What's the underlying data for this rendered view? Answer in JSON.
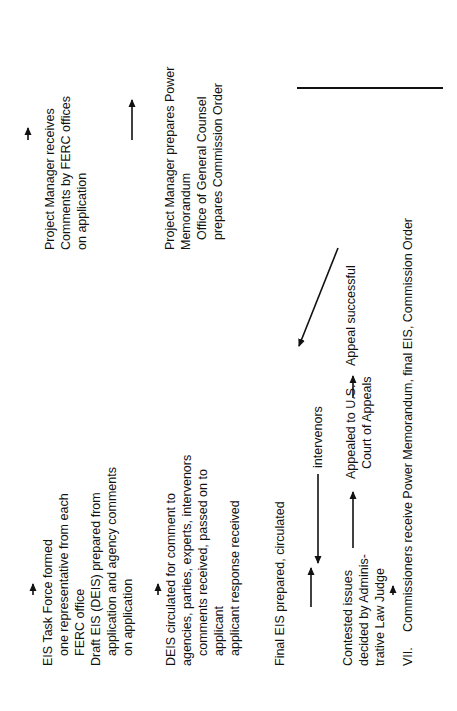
{
  "blocks": {
    "task_force": {
      "lines": [
        "EIS Task Force formed",
        "one representative from each",
        "FERC office",
        "Draft EIS (DEIS) prepared from",
        "application and agency comments",
        "on application"
      ]
    },
    "deis_circulated": {
      "lines": [
        "DEIS circulated for comment to",
        "agencies, parties, experts, intervenors",
        "comments received, passed on to",
        "applicant",
        "applicant response received"
      ]
    },
    "final_eis": {
      "lines": [
        "Final EIS prepared, circulated"
      ]
    },
    "intervenors": {
      "label": "intervenors"
    },
    "contested": {
      "lines": [
        "Contested issues",
        "decided by Adminis-",
        "trative Law Judge"
      ]
    },
    "appealed": {
      "lines": [
        "Appealed to U.S.",
        "Court of Appeals"
      ]
    },
    "appeal_successful": {
      "label": "Appeal successful"
    },
    "pm_receives": {
      "lines": [
        "Project Manager receives",
        "Comments by FERC offices",
        "on application"
      ]
    },
    "pm_prepares": {
      "lines": [
        "Project Manager prepares Power",
        "Memorandum",
        "Office of General Counsel",
        "prepares Commission Order"
      ]
    },
    "step_vii": {
      "numeral": "VII.",
      "text": "Commissioners receive Power Memorandum, final EIS, Commission Order"
    }
  }
}
